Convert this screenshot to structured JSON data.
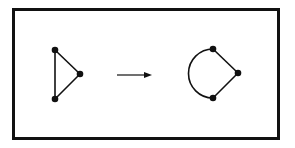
{
  "diagram": {
    "type": "graph-transformation",
    "colors": {
      "stroke": "#111111",
      "background": "#ffffff",
      "arrow": "#333333"
    },
    "left_graph": {
      "shape": "triangle",
      "vertices": [
        {
          "id": "a",
          "x": 55,
          "y": 50
        },
        {
          "id": "b",
          "x": 80,
          "y": 74
        },
        {
          "id": "c",
          "x": 55,
          "y": 99
        }
      ],
      "edges": [
        {
          "from": "a",
          "to": "b",
          "kind": "straight"
        },
        {
          "from": "b",
          "to": "c",
          "kind": "straight"
        },
        {
          "from": "c",
          "to": "a",
          "kind": "straight"
        }
      ]
    },
    "arrow": {
      "x1": 117,
      "y1": 75,
      "x2": 152,
      "y2": 75,
      "direction": "right"
    },
    "right_graph": {
      "shape": "triangle-with-curved-edge",
      "vertices": [
        {
          "id": "a",
          "x": 213,
          "y": 49
        },
        {
          "id": "b",
          "x": 238,
          "y": 73
        },
        {
          "id": "c",
          "x": 213,
          "y": 98
        }
      ],
      "edges": [
        {
          "from": "a",
          "to": "b",
          "kind": "straight"
        },
        {
          "from": "b",
          "to": "c",
          "kind": "straight"
        },
        {
          "from": "c",
          "to": "a",
          "kind": "arc"
        }
      ]
    }
  }
}
